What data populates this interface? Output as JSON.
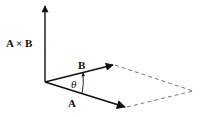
{
  "diagram": {
    "labels": {
      "cross_product": "A × B",
      "vector_b": "B",
      "vector_a": "A",
      "angle": "θ"
    },
    "points": {
      "origin": [
        45,
        82
      ],
      "cross_tip": [
        45,
        5
      ],
      "b_tip": [
        113,
        65
      ],
      "a_tip": [
        125,
        107
      ],
      "far_corner": [
        193,
        91
      ]
    },
    "colors": {
      "stroke": "#111111",
      "dashed": "#555555",
      "background": "#ffffff"
    }
  }
}
